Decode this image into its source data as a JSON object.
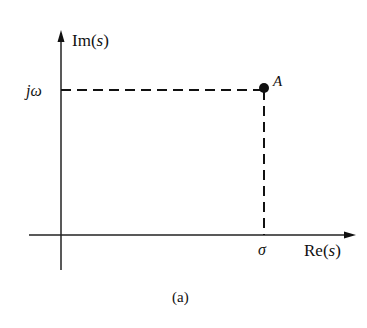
{
  "diagram": {
    "axes": {
      "vertical_label_prefix": "Im",
      "vertical_label_var": "s",
      "horizontal_label_prefix": "Re",
      "horizontal_label_var": "s"
    },
    "point": {
      "label": "A",
      "x_label": "σ",
      "y_label": "jω"
    },
    "caption": "(a)",
    "colors": {
      "stroke": "#111111",
      "background": "#ffffff"
    }
  }
}
